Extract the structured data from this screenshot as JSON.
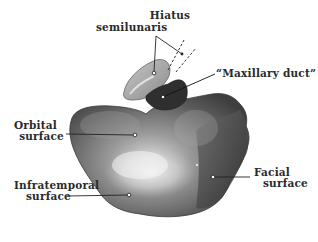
{
  "figure": {
    "background": "#ffffff",
    "ink": "#2a2a2a"
  },
  "labels": {
    "hiatus": {
      "line1": "Hiatus",
      "line2": "semilunaris"
    },
    "maxillary_duct": {
      "text": "“Maxillary duct”"
    },
    "orbital": {
      "line1": "Orbital",
      "line2": "surface"
    },
    "infratemporal": {
      "line1": "Infratemporal",
      "line2": "surface"
    },
    "facial": {
      "line1": "Facial",
      "line2": "surface"
    }
  }
}
